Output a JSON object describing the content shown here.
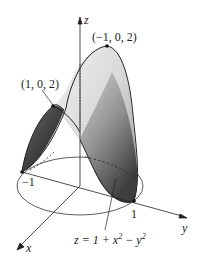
{
  "figure": {
    "equation": {
      "lhs": "z = 1 + x",
      "exp1": "2",
      "mid": " − y",
      "exp2": "2"
    },
    "axes": {
      "x_label": "x",
      "y_label": "y",
      "z_label": "z"
    },
    "points": {
      "top_right": "(−1, 0, 2)",
      "top_left": "(1, 0, 2)"
    },
    "ticks": {
      "neg_one": "−1",
      "pos_one": "1"
    },
    "colors": {
      "line": "#222222",
      "surface_light": "#e4e4e4",
      "surface_mid": "#a8a8a8",
      "surface_dark": "#4a4a4a"
    }
  }
}
